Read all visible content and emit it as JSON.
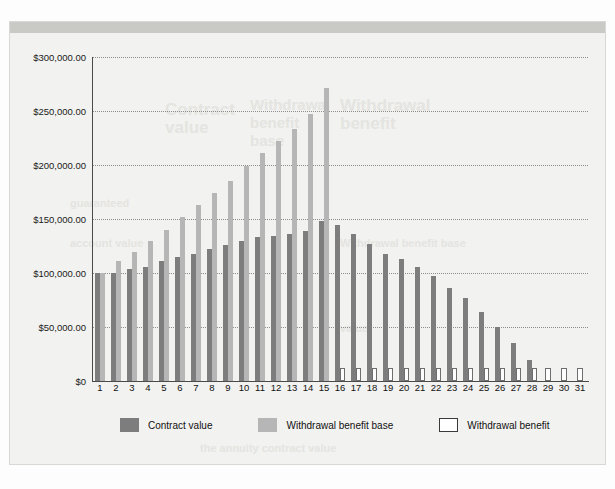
{
  "top_caption": "",
  "panel": {
    "ghost_texts": {
      "a": "Contract",
      "b": "value",
      "c": "Withdrawal",
      "d": "benefit",
      "e": "base",
      "f": "Withdrawal",
      "g": "benefit",
      "h": "guaranteed",
      "i": "account value",
      "j": "Withdrawal benefit base",
      "k": "the annuity contract value",
      "l": "value"
    }
  },
  "legend": {
    "items": [
      {
        "label": "Contract value",
        "swatch": "contract",
        "color": "#7d7d7d"
      },
      {
        "label": "Withdrawal benefit base",
        "swatch": "base",
        "color": "#b6b6b6"
      },
      {
        "label": "Withdrawal benefit",
        "swatch": "benefit",
        "color": "#ffffff"
      }
    ]
  },
  "chart_data": {
    "type": "bar",
    "title": "",
    "subtitle": "",
    "xlabel": "",
    "ylabel": "",
    "grid": true,
    "legend_position": "bottom",
    "ylim": [
      0,
      300000
    ],
    "ytick_labels": [
      "$0",
      "$50,000.00",
      "$100,000.00",
      "$150,000.00",
      "$200,000.00",
      "$250,000.00",
      "$300,000.00"
    ],
    "ytick_values": [
      0,
      50000,
      100000,
      150000,
      200000,
      250000,
      300000
    ],
    "categories": [
      1,
      2,
      3,
      4,
      5,
      6,
      7,
      8,
      9,
      10,
      11,
      12,
      13,
      14,
      15,
      16,
      17,
      18,
      19,
      20,
      21,
      22,
      23,
      24,
      25,
      26,
      27,
      28,
      29,
      30,
      31
    ],
    "series": [
      {
        "name": "Contract value",
        "color": "#7d7d7d",
        "values": [
          100000,
          100000,
          104000,
          106000,
          111000,
          115000,
          118000,
          122000,
          126000,
          130000,
          133000,
          134000,
          136000,
          139000,
          148000,
          144000,
          136000,
          127000,
          118000,
          113000,
          106000,
          97000,
          86000,
          77000,
          64000,
          50000,
          35000,
          19000,
          0,
          0,
          0
        ]
      },
      {
        "name": "Withdrawal benefit base",
        "color": "#b6b6b6",
        "values": [
          100000,
          111000,
          119000,
          130000,
          140000,
          152000,
          163000,
          174000,
          185000,
          199000,
          211000,
          222000,
          233000,
          247000,
          271000,
          0,
          0,
          0,
          0,
          0,
          0,
          0,
          0,
          0,
          0,
          0,
          0,
          0,
          0,
          0,
          0
        ]
      },
      {
        "name": "Withdrawal benefit",
        "color": "#ffffff",
        "values": [
          0,
          0,
          0,
          0,
          0,
          0,
          0,
          0,
          0,
          0,
          0,
          0,
          0,
          0,
          0,
          12000,
          12000,
          12000,
          12000,
          12000,
          12000,
          12000,
          12000,
          12000,
          12000,
          12000,
          12000,
          12000,
          12000,
          12000,
          12000
        ]
      }
    ]
  }
}
